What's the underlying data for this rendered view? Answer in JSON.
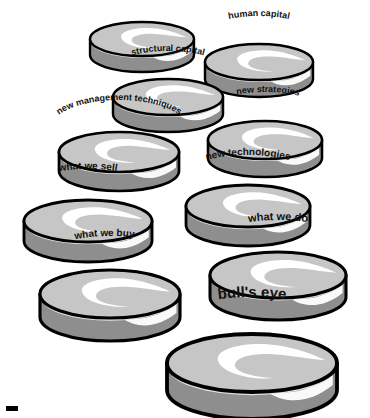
{
  "diagram": {
    "type": "illustration",
    "background_color": "#ffffff",
    "palette": {
      "disc_top": "#c6c6c6",
      "disc_side": "#8e8e8e",
      "disc_rim": "#e2e2e2",
      "highlight": "#ffffff",
      "outline": "#000000",
      "label_color": "#111111"
    },
    "corner_mark": {
      "name": "corner-artifact",
      "x": 6,
      "y": 406,
      "width": 12,
      "height": 5,
      "color": "#000000"
    },
    "discs": [
      {
        "id": "customer-capital",
        "label": "customer capital",
        "cx": 142,
        "cy": 39,
        "rx": 52,
        "ry": 17,
        "height": 16,
        "font_size": 9,
        "label_arc_rx": 62,
        "label_arc_ry": 24,
        "label_dy": -20,
        "label_offset": 0.5
      },
      {
        "id": "human-capital",
        "label": "human  capital",
        "cx": 259,
        "cy": 62,
        "rx": 54,
        "ry": 18,
        "height": 17,
        "font_size": 9,
        "label_arc_rx": 63,
        "label_arc_ry": 25,
        "label_dy": -21,
        "label_offset": 0.5
      },
      {
        "id": "structural-capital",
        "label": "structural capital",
        "cx": 168,
        "cy": 97,
        "rx": 55,
        "ry": 18,
        "height": 17,
        "font_size": 9,
        "label_arc_rx": 64,
        "label_arc_ry": 25,
        "label_dy": -21,
        "label_offset": 0.5
      },
      {
        "id": "new-strategies",
        "label": "new strategies",
        "cx": 265,
        "cy": 140,
        "rx": 57,
        "ry": 19,
        "height": 18,
        "font_size": 9,
        "label_arc_rx": 66,
        "label_arc_ry": 26,
        "label_dy": -22,
        "label_offset": 0.52
      },
      {
        "id": "new-management-techniques",
        "label": "new management techniques",
        "cx": 119,
        "cy": 152,
        "rx": 60,
        "ry": 20,
        "height": 19,
        "font_size": 9,
        "label_arc_rx": 70,
        "label_arc_ry": 30,
        "label_dy": -22,
        "label_offset": 0.5
      },
      {
        "id": "new-technologies",
        "label": "new technologies",
        "cx": 248,
        "cy": 206,
        "rx": 62,
        "ry": 21,
        "height": 19,
        "font_size": 10,
        "label_arc_rx": 71,
        "label_arc_ry": 28,
        "label_dy": -23,
        "label_offset": 0.5
      },
      {
        "id": "what-we-sell",
        "label": "what we sell",
        "cx": 88,
        "cy": 221,
        "rx": 64,
        "ry": 21,
        "height": 20,
        "font_size": 10,
        "label_arc_rx": 74,
        "label_arc_ry": 28,
        "label_dy": -24,
        "label_offset": 0.5
      },
      {
        "id": "what-we-do",
        "label": "what we do",
        "cx": 278,
        "cy": 275,
        "rx": 68,
        "ry": 23,
        "height": 22,
        "font_size": 11,
        "label_arc_rx": 78,
        "label_arc_ry": 30,
        "label_dy": -25,
        "label_offset": 0.5
      },
      {
        "id": "what-we-buy",
        "label": "what we buy",
        "cx": 110,
        "cy": 294,
        "rx": 70,
        "ry": 24,
        "height": 23,
        "font_size": 10,
        "label_arc_rx": 80,
        "label_arc_ry": 32,
        "label_dy": -26,
        "label_offset": 0.47
      },
      {
        "id": "bulls-eye",
        "label": "bull's eye",
        "cx": 252,
        "cy": 363,
        "rx": 85,
        "ry": 29,
        "height": 27,
        "font_size": 15,
        "label_arc_rx": 96,
        "label_arc_ry": 36,
        "label_dy": -30,
        "label_offset": 0.5
      }
    ]
  }
}
